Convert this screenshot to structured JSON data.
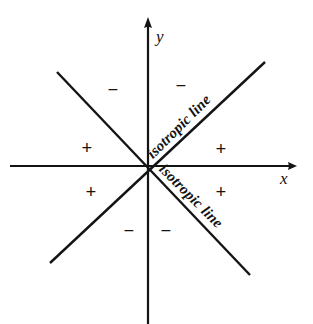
{
  "figure": {
    "background_color": "#ffffff",
    "stroke_color": "#141414",
    "width": 313,
    "height": 324
  },
  "axes": {
    "x_label": "x",
    "y_label": "y",
    "origin": {
      "x": 148,
      "y": 166
    },
    "x_axis": {
      "x1": 10,
      "y1": 166,
      "x2": 297,
      "y2": 166,
      "arrow": "right"
    },
    "y_axis": {
      "x1": 148,
      "y1": 20,
      "x2": 148,
      "y2": 324,
      "arrow": "up"
    }
  },
  "isotropic_lines": [
    {
      "name": "isotropic-line-upper-right",
      "label": "isotropic line",
      "slope": 1,
      "rotation_deg": -45,
      "x1": 57,
      "y1": 72,
      "x2": 265,
      "y2": 62
    },
    {
      "name": "isotropic-line-lower-right",
      "label": "isotropic line",
      "slope": -1,
      "rotation_deg": 45,
      "x1": 50,
      "y1": 263,
      "x2": 250,
      "y2": 275
    }
  ],
  "signs": [
    {
      "name": "sign-upper-left-minus",
      "symbol": "−",
      "x": 113,
      "y": 80,
      "region": "between y-axis and upper-left diagonal"
    },
    {
      "name": "sign-upper-right-minus",
      "symbol": "−",
      "x": 180,
      "y": 75,
      "region": "between y-axis and upper-right diagonal"
    },
    {
      "name": "sign-left-upper-plus",
      "symbol": "+",
      "x": 86,
      "y": 138,
      "region": "between upper-left diagonal and negative x-axis"
    },
    {
      "name": "sign-right-upper-plus",
      "symbol": "+",
      "x": 220,
      "y": 139,
      "region": "between upper-right diagonal and positive x-axis"
    },
    {
      "name": "sign-left-lower-plus",
      "symbol": "+",
      "x": 90,
      "y": 182,
      "region": "between negative x-axis and lower-left diagonal"
    },
    {
      "name": "sign-right-lower-plus",
      "symbol": "+",
      "x": 220,
      "y": 182,
      "region": "between positive x-axis and lower-right diagonal"
    },
    {
      "name": "sign-lower-left-minus",
      "symbol": "−",
      "x": 128,
      "y": 221,
      "region": "between lower-left diagonal and negative y-axis"
    },
    {
      "name": "sign-lower-right-minus",
      "symbol": "−",
      "x": 165,
      "y": 221,
      "region": "between negative y-axis and lower-right diagonal"
    }
  ]
}
